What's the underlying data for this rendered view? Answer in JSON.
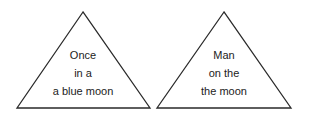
{
  "puzzles": [
    {
      "lines": [
        "Once",
        "in a",
        "a blue moon"
      ]
    },
    {
      "lines": [
        "Man",
        "on the",
        "the moon"
      ]
    }
  ]
}
